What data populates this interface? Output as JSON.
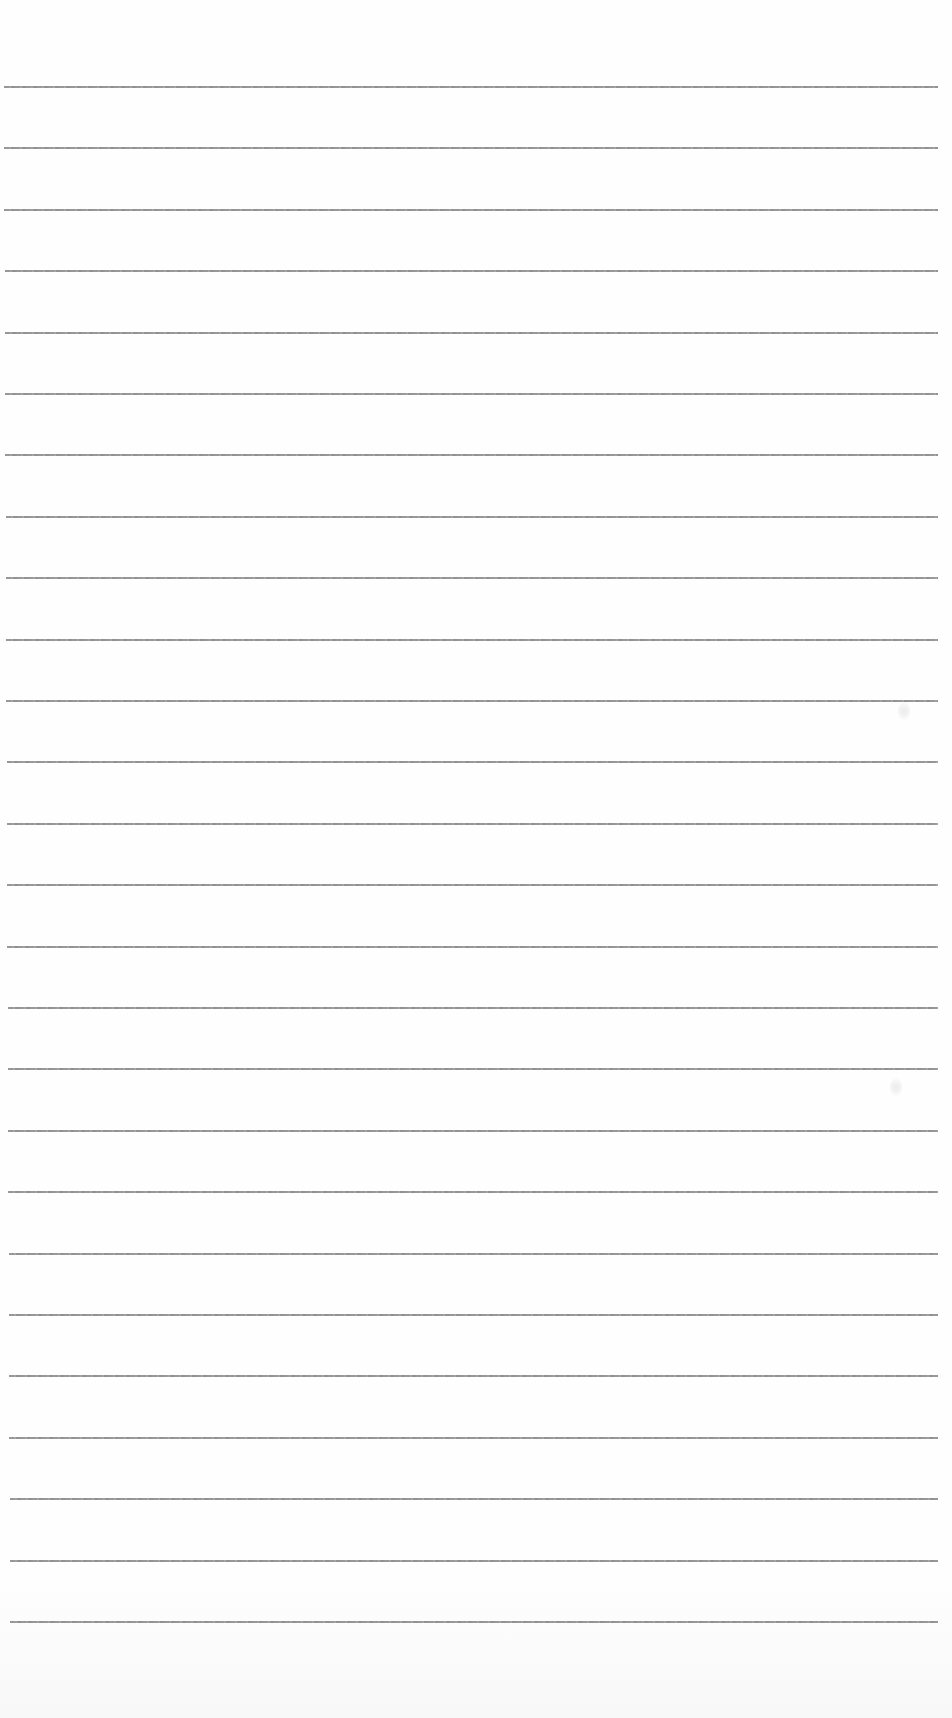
{
  "document": {
    "type": "ruled-paper",
    "background_color": "#fefefe",
    "line_color": "#8c8c8c",
    "line_count": 26,
    "line_thickness_px": 2,
    "first_line_y": 86,
    "line_spacing_px": 61.4,
    "line_left_start_px": 4,
    "line_left_end_px": 10,
    "line_right_px": 938,
    "text_content": []
  }
}
